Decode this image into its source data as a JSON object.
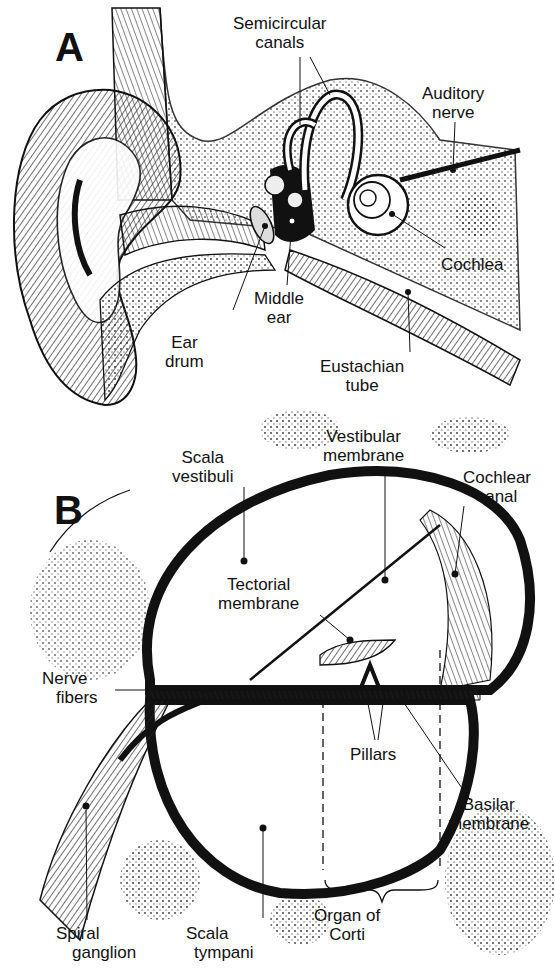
{
  "figure": {
    "panels": [
      {
        "id": "A",
        "letter": "A",
        "labels": {
          "semicircular_canals": [
            "Semicircular",
            "canals"
          ],
          "auditory_nerve": [
            "Auditory",
            "nerve"
          ],
          "cochlea": [
            "Cochlea"
          ],
          "middle_ear": [
            "Middle",
            "ear"
          ],
          "ear_drum": [
            "Ear",
            "drum"
          ],
          "eustachian_tube": [
            "Eustachian",
            "tube"
          ]
        }
      },
      {
        "id": "B",
        "letter": "B",
        "labels": {
          "scala_vestibuli": [
            "Scala",
            "vestibuli"
          ],
          "vestibular_membrane": [
            "Vestibular",
            "membrane"
          ],
          "cochlear_canal": [
            "Cochlear",
            "canal"
          ],
          "tectorial_membrane": [
            "Tectorial",
            "membrane"
          ],
          "nerve_fibers": [
            "Nerve",
            "fibers"
          ],
          "pillars": [
            "Pillars"
          ],
          "basilar_membrane": [
            "Basilar",
            "membrane"
          ],
          "spiral_ganglion": [
            "Spiral",
            "ganglion"
          ],
          "scala_tympani": [
            "Scala",
            "tympani"
          ],
          "organ_of_corti": [
            "Organ of",
            "Corti"
          ]
        }
      }
    ]
  },
  "colors": {
    "ink": "#111111",
    "paper": "#ffffff",
    "stipple": "#555555"
  }
}
